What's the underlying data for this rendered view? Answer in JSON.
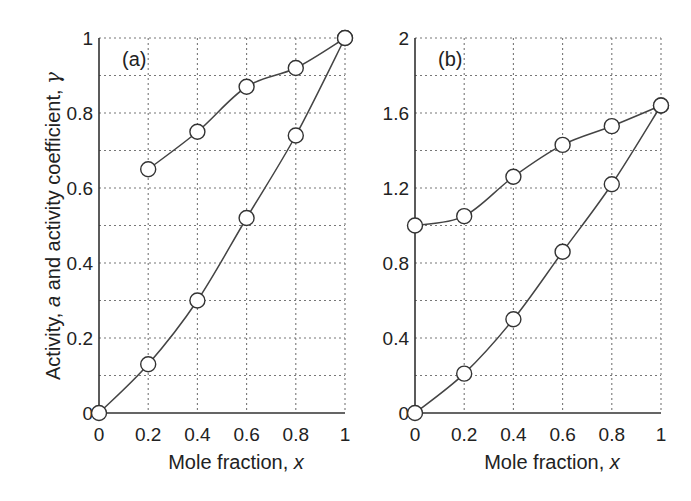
{
  "figure": {
    "ylabel_parts": [
      "Activity, ",
      "a",
      " and activity coefficient, ",
      "γ"
    ],
    "xlabel_parts": [
      "Mole fraction, ",
      "x"
    ]
  },
  "chart_data": [
    {
      "type": "line",
      "panel_label": "(a)",
      "title": "",
      "xlabel": "Mole fraction, x",
      "ylabel": "Activity, a and activity coefficient, γ",
      "xlim": [
        0,
        1
      ],
      "ylim": [
        0,
        1
      ],
      "x_ticks": [
        "0",
        "0.2",
        "0.4",
        "0.6",
        "0.8",
        "1"
      ],
      "y_ticks": [
        "0",
        "0.2",
        "0.4",
        "0.6",
        "0.8",
        "1"
      ],
      "grid": true,
      "legend": "none",
      "markers": "open circles",
      "series": [
        {
          "name": "activity coefficient, γ",
          "x": [
            0.2,
            0.4,
            0.6,
            0.8,
            1.0
          ],
          "values": [
            0.65,
            0.75,
            0.87,
            0.92,
            1.0
          ]
        },
        {
          "name": "activity, a",
          "x": [
            0,
            0.2,
            0.4,
            0.6,
            0.8,
            1.0
          ],
          "values": [
            0,
            0.13,
            0.3,
            0.52,
            0.74,
            1.0
          ]
        }
      ]
    },
    {
      "type": "line",
      "panel_label": "(b)",
      "title": "",
      "xlabel": "Mole fraction, x",
      "ylabel": "",
      "xlim": [
        0,
        1
      ],
      "ylim": [
        0,
        2
      ],
      "x_ticks": [
        "0",
        "0.2",
        "0.4",
        "0.6",
        "0.8",
        "1"
      ],
      "y_ticks": [
        "0",
        "0.4",
        "0.8",
        "1.2",
        "1.6",
        "2"
      ],
      "grid": true,
      "legend": "none",
      "markers": "open circles",
      "series": [
        {
          "name": "activity coefficient, γ",
          "x": [
            0,
            0.2,
            0.4,
            0.6,
            0.8,
            1.0
          ],
          "values": [
            1.0,
            1.05,
            1.26,
            1.43,
            1.53,
            1.64
          ]
        },
        {
          "name": "activity, a",
          "x": [
            0,
            0.2,
            0.4,
            0.6,
            0.8,
            1.0
          ],
          "values": [
            0,
            0.21,
            0.5,
            0.86,
            1.22,
            1.64
          ]
        }
      ]
    }
  ]
}
